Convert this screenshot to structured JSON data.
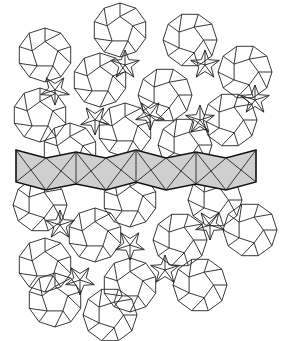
{
  "figure": {
    "type": "aperiodic-tiling",
    "colors": {
      "line": "#222222",
      "band_fill": "#cfcfcf",
      "band_outline": "#111111",
      "background": "#ffffff"
    },
    "band": {
      "x_start": 16,
      "x_end": 256,
      "y_top": 152,
      "y_bottom": 184,
      "segments": 4
    },
    "tile_radius": 27,
    "centers": [
      [
        120,
        30
      ],
      [
        190,
        40
      ],
      [
        45,
        55
      ],
      [
        245,
        72
      ],
      [
        100,
        80
      ],
      [
        165,
        95
      ],
      [
        40,
        115
      ],
      [
        230,
        120
      ],
      [
        125,
        130
      ],
      [
        185,
        145
      ],
      [
        70,
        150
      ],
      [
        40,
        205
      ],
      [
        130,
        200
      ],
      [
        215,
        200
      ],
      [
        95,
        235
      ],
      [
        180,
        240
      ],
      [
        45,
        265
      ],
      [
        250,
        230
      ],
      [
        130,
        285
      ],
      [
        200,
        285
      ],
      [
        55,
        300
      ],
      [
        110,
        315
      ]
    ],
    "star_centers": [
      [
        125,
        65
      ],
      [
        55,
        90
      ],
      [
        205,
        65
      ],
      [
        150,
        115
      ],
      [
        255,
        100
      ],
      [
        95,
        120
      ],
      [
        200,
        120
      ],
      [
        130,
        245
      ],
      [
        60,
        225
      ],
      [
        210,
        225
      ],
      [
        165,
        270
      ],
      [
        80,
        280
      ]
    ]
  }
}
